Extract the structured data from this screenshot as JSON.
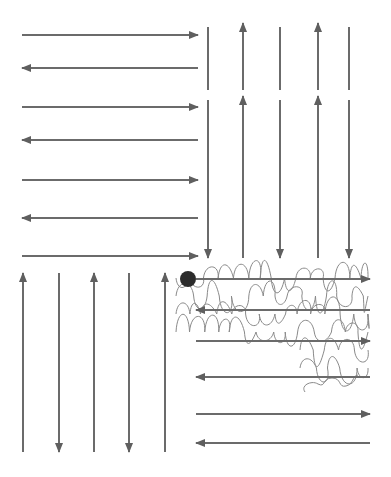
{
  "diagram": {
    "colors": {
      "arrow": "#6b6b6b",
      "meander": "#8a8a8a",
      "dot": "#2b2b2b",
      "background": "#ffffff"
    },
    "blocks": [
      {
        "name": "top-left-horizontal",
        "orientation": "horizontal",
        "x1": 22,
        "x2": 198,
        "rows": [
          {
            "y": 35,
            "dir": "right"
          },
          {
            "y": 68,
            "dir": "left"
          },
          {
            "y": 107,
            "dir": "right"
          },
          {
            "y": 140,
            "dir": "left"
          },
          {
            "y": 180,
            "dir": "right"
          },
          {
            "y": 218,
            "dir": "left"
          },
          {
            "y": 256,
            "dir": "right"
          }
        ]
      },
      {
        "name": "top-right-vertical",
        "orientation": "vertical",
        "segments": [
          {
            "y1": 27,
            "y2": 90
          },
          {
            "y1": 100,
            "y2": 258
          }
        ],
        "columns": [
          {
            "x": 208,
            "dir": "down"
          },
          {
            "x": 243,
            "dir": "up"
          },
          {
            "x": 280,
            "dir": "down"
          },
          {
            "x": 318,
            "dir": "up"
          },
          {
            "x": 349,
            "dir": "down"
          }
        ]
      },
      {
        "name": "bottom-left-vertical",
        "orientation": "vertical",
        "y1": 273,
        "y2": 452,
        "columns": [
          {
            "x": 23,
            "dir": "up"
          },
          {
            "x": 59,
            "dir": "down"
          },
          {
            "x": 94,
            "dir": "up"
          },
          {
            "x": 129,
            "dir": "down"
          },
          {
            "x": 165,
            "dir": "up"
          }
        ]
      },
      {
        "name": "bottom-right-horizontal",
        "orientation": "horizontal",
        "x1": 196,
        "x2": 370,
        "rows": [
          {
            "y": 279,
            "dir": "right"
          },
          {
            "y": 310,
            "dir": "left"
          },
          {
            "y": 341,
            "dir": "right"
          },
          {
            "y": 377,
            "dir": "left"
          },
          {
            "y": 414,
            "dir": "right"
          },
          {
            "y": 443,
            "dir": "left"
          }
        ]
      }
    ],
    "start_dot": {
      "cx": 188,
      "cy": 279,
      "r": 8
    },
    "meander_region": {
      "x": 172,
      "y": 262,
      "width": 200,
      "height": 128
    }
  }
}
